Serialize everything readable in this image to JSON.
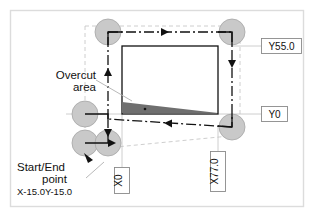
{
  "diagram": {
    "frame": {
      "border_color": "#d9d9d9",
      "background": "#ffffff"
    },
    "colors": {
      "tool_circle_fill": "#c9c9c9",
      "tool_circle_stroke": "#9a9a9a",
      "overcut_fill": "#6f6f6f",
      "path_line": "#111111",
      "guide_line": "#b5b5b5",
      "workpiece_stroke": "#111111",
      "leader_line": "#b0b0b0",
      "label_box_stroke": "#8a8a8a"
    },
    "annotations": {
      "overcut_line1": "Overcut",
      "overcut_line2": "area",
      "start_end_line1": "Start/End",
      "start_end_line2": "point",
      "start_end_coords": "X-15.0Y-15.0"
    },
    "dimension_labels": [
      {
        "name": "y-top",
        "text": "Y55.0",
        "orientation": "horizontal"
      },
      {
        "name": "y-bottom",
        "text": "Y0",
        "orientation": "horizontal"
      },
      {
        "name": "x-left",
        "text": "X0",
        "orientation": "vertical"
      },
      {
        "name": "x-right",
        "text": "X77.0",
        "orientation": "vertical"
      }
    ],
    "workpiece": {
      "x_min": "X0",
      "x_max": "X77.0",
      "y_min": "Y0",
      "y_max": "Y55.0"
    },
    "tool_positions": [
      {
        "name": "tool-top-left",
        "cx": 108,
        "cy": 32,
        "r": 13
      },
      {
        "name": "tool-top-right",
        "cx": 232,
        "cy": 32,
        "r": 13
      },
      {
        "name": "tool-mid-left",
        "cx": 85,
        "cy": 114,
        "r": 13
      },
      {
        "name": "tool-bottom-right",
        "cx": 232,
        "cy": 127,
        "r": 13
      },
      {
        "name": "tool-start-left",
        "cx": 85,
        "cy": 143,
        "r": 13
      },
      {
        "name": "tool-start-right",
        "cx": 108,
        "cy": 143,
        "r": 13
      }
    ],
    "path_directions": [
      {
        "name": "arrow-top-right",
        "direction": "right"
      },
      {
        "name": "arrow-right-down",
        "direction": "down"
      },
      {
        "name": "arrow-bottom-left",
        "direction": "left"
      },
      {
        "name": "arrow-left-up",
        "direction": "up"
      },
      {
        "name": "arrow-start-down",
        "direction": "down"
      },
      {
        "name": "arrow-start-right",
        "direction": "right"
      }
    ]
  }
}
